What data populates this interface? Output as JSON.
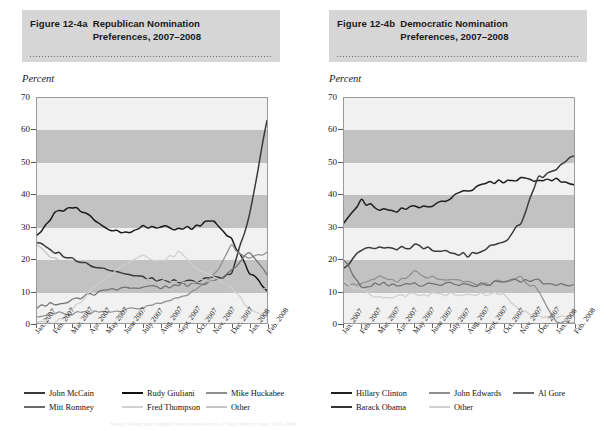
{
  "figure_a": {
    "fignum": "Figure 12-4a",
    "title_line1": "Republican Nomination",
    "title_line2": "Preferences, 2007–2008",
    "axis_label": "Percent"
  },
  "figure_b": {
    "fignum": "Figure 12-4b",
    "title_line1": "Democratic Nomination",
    "title_line2": "Preferences, 2007–2008",
    "axis_label": "Percent"
  },
  "source_note": "Source: Polling data compiled from national surveys of likely primary voters, 2007–2008.",
  "colors": {
    "banner": "#d6d6d6",
    "band_dark": "#c2c2c2",
    "band_light": "#f1f1f1",
    "frame": "#9a9a9a",
    "mccain": "#3a3a3a",
    "giuliani": "#1a1a1a",
    "huckabee": "#8f8f8f",
    "romney": "#707070",
    "thompson": "#cfcfcf",
    "other": "#c4c4c4",
    "clinton": "#1f1f1f",
    "obama": "#3a3a3a",
    "edwards": "#8f8f8f",
    "algore": "#707070",
    "dem_other": "#cfcfcf"
  },
  "chart_data": [
    {
      "type": "line",
      "title": "Republican Nomination Preferences, 2007–2008",
      "xlabel": "",
      "ylabel": "Percent",
      "ylim": [
        0,
        70
      ],
      "yticks": [
        0,
        10,
        20,
        30,
        40,
        50,
        60,
        70
      ],
      "grid": "alternating horizontal bands (shaded 10–20, 30–40, 50–60)",
      "legend_position": "below-plot",
      "categories": [
        "Jan. 2007",
        "Feb. 2007",
        "Mar. 2007",
        "Apr. 2007",
        "May 2007",
        "June 2007",
        "July 2007",
        "Aug. 2007",
        "Sept. 2007",
        "Oct. 2007",
        "Nov. 2007",
        "Dec. 2007",
        "Jan. 2008",
        "Feb. 2008"
      ],
      "series": [
        {
          "name": "John McCain",
          "color": "#3a3a3a",
          "values": [
            25,
            22,
            20,
            18,
            16,
            15,
            14,
            13,
            13,
            13,
            14,
            15,
            33,
            63
          ]
        },
        {
          "name": "Rudy Giuliani",
          "color": "#1a1a1a",
          "values": [
            27,
            34,
            36,
            33,
            29,
            28,
            30,
            30,
            29,
            30,
            32,
            26,
            16,
            10
          ]
        },
        {
          "name": "Mike Huckabee",
          "color": "#8f8f8f",
          "values": [
            2,
            3,
            3,
            3,
            4,
            4,
            5,
            6,
            8,
            10,
            15,
            24,
            20,
            22
          ]
        },
        {
          "name": "Mitt Romney",
          "color": "#707070",
          "values": [
            5,
            6,
            7,
            9,
            10,
            11,
            11,
            11,
            12,
            12,
            13,
            16,
            22,
            15
          ]
        },
        {
          "name": "Fred Thompson",
          "color": "#cfcfcf",
          "values": [
            0,
            0,
            4,
            10,
            14,
            18,
            21,
            19,
            22,
            17,
            14,
            11,
            4,
            2
          ]
        },
        {
          "name": "Other",
          "color": "#c4c4c4",
          "values": [
            24,
            20,
            17,
            15,
            14,
            13,
            13,
            13,
            13,
            13,
            13,
            12,
            11,
            11
          ]
        }
      ]
    },
    {
      "type": "line",
      "title": "Democratic Nomination Preferences, 2007–2008",
      "xlabel": "",
      "ylabel": "Percent",
      "ylim": [
        0,
        70
      ],
      "yticks": [
        0,
        10,
        20,
        30,
        40,
        50,
        60,
        70
      ],
      "grid": "alternating horizontal bands (shaded 10–20, 30–40, 50–60)",
      "legend_position": "below-plot",
      "categories": [
        "Jan. 2007",
        "Feb. 2007",
        "Mar. 2007",
        "Apr. 2007",
        "May 2007",
        "June 2007",
        "July 2007",
        "Aug. 2007",
        "Sept. 2007",
        "Oct. 2007",
        "Nov. 2007",
        "Dec. 2007",
        "Jan. 2008",
        "Feb. 2008"
      ],
      "series": [
        {
          "name": "Hillary Clinton",
          "color": "#1f1f1f",
          "values": [
            31,
            38,
            35,
            35,
            36,
            36,
            39,
            41,
            44,
            44,
            45,
            44,
            45,
            43
          ]
        },
        {
          "name": "Barack Obama",
          "color": "#3a3a3a",
          "values": [
            17,
            23,
            23,
            23,
            24,
            23,
            22,
            21,
            23,
            25,
            31,
            45,
            48,
            52
          ]
        },
        {
          "name": "John Edwards",
          "color": "#8f8f8f",
          "values": [
            12,
            12,
            14,
            13,
            16,
            14,
            13,
            13,
            12,
            13,
            14,
            10,
            0,
            0
          ]
        },
        {
          "name": "Al Gore",
          "color": "#707070",
          "values": [
            20,
            11,
            12,
            12,
            12,
            12,
            12,
            12,
            12,
            13,
            13,
            13,
            12,
            12
          ]
        },
        {
          "name": "Other",
          "color": "#cfcfcf",
          "values": [
            13,
            10,
            8,
            8,
            9,
            9,
            9,
            9,
            9,
            9,
            4,
            2,
            2,
            2
          ]
        }
      ]
    }
  ],
  "legend_a": {
    "row1": [
      {
        "label": "John McCain",
        "color": "#3a3a3a"
      },
      {
        "label": "Rudy Giuliani",
        "color": "#111111"
      },
      {
        "label": "Mike Huckabee",
        "color": "#8f8f8f"
      }
    ],
    "row2": [
      {
        "label": "Mitt Romney",
        "color": "#6a6a6a"
      },
      {
        "label": "Fred Thompson",
        "color": "#d2d2d2"
      },
      {
        "label": "Other",
        "color": "#c6c6c6"
      }
    ]
  },
  "legend_b": {
    "row1": [
      {
        "label": "Hillary Clinton",
        "color": "#1f1f1f"
      },
      {
        "label": "John Edwards",
        "color": "#8f8f8f"
      },
      {
        "label": "Al Gore",
        "color": "#6a6a6a"
      }
    ],
    "row2": [
      {
        "label": "Barack Obama",
        "color": "#333333"
      },
      {
        "label": "Other",
        "color": "#d2d2d2"
      }
    ]
  }
}
